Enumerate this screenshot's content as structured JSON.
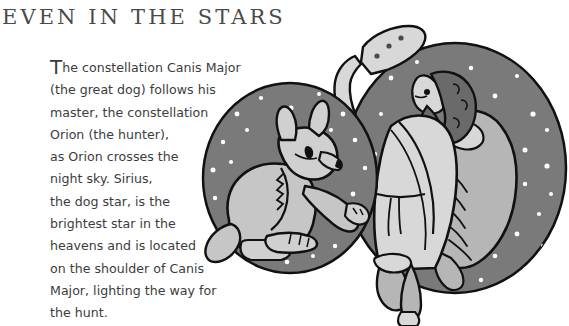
{
  "page": {
    "title": "EVEN IN THE STARS",
    "background_color": "#ffffff",
    "text_color": "#3c3c3c",
    "title_color": "#4a4a4a"
  },
  "body": {
    "dropcap": "T",
    "lines": [
      "he constellation Canis Major",
      "(the great dog) follows his",
      "master, the constellation",
      "Orion (the hunter),",
      "as Orion crosses the",
      "night sky. Sirius,",
      "the dog star, is the",
      "brightest star in the",
      "heavens and is located",
      "on the shoulder of Canis",
      "Major, lighting the way for",
      "the hunt."
    ],
    "full_text": "The constellation Canis Major (the great dog) follows his master, the constellation Orion (the hunter), as Orion crosses the night sky. Sirius, the dog star, is the brightest star in the heavens and is located on the shoulder of Canis Major, lighting the way for the hunt."
  },
  "illustration": {
    "name": "canis-major-and-orion-illustration",
    "colors": {
      "sky": "#7a7a7a",
      "star": "#ffffff",
      "figure_light": "#d8d8d8",
      "figure_mid": "#b6b6b6",
      "figure_shade": "#9b9b9b",
      "hair_dark": "#6a6a6a",
      "outline": "#111111"
    },
    "elements": {
      "left_circle_label": "night-sky-circle-dog",
      "right_circle_label": "night-sky-circle-hunter",
      "dog_label": "canis-major-dog-figure",
      "hunter_label": "orion-hunter-figure",
      "club_label": "orion-club",
      "pelt_label": "orion-lion-pelt"
    }
  }
}
